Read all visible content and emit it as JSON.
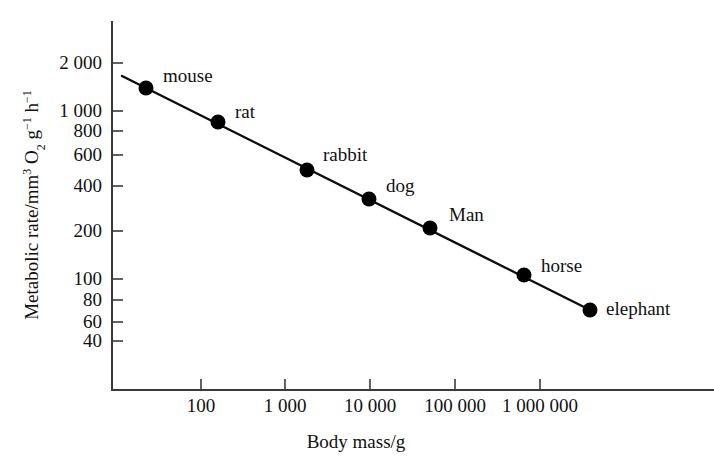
{
  "chart_data": {
    "type": "scatter",
    "title": "",
    "subtitle": "",
    "xlabel": "Body mass/g",
    "ylabel": "Metabolic rate/mm3 O2 g-1 h-1",
    "ylabel_parts": {
      "lead": "Metabolic rate/mm",
      "sup1": "3",
      "mid1": " O",
      "sub1": "2",
      "mid2": " g",
      "sup2": "−1",
      "mid3": " h",
      "sup3": "−1"
    },
    "xscale": "log",
    "yscale": "log",
    "xlim": [
      25,
      8000000
    ],
    "ylim": [
      33,
      3000
    ],
    "grid": false,
    "legend": "none",
    "x_tick_labels": [
      "100",
      "1 000",
      "10 000",
      "100 000",
      "1 000 000"
    ],
    "x_tick_values": [
      100,
      1000,
      10000,
      100000,
      1000000
    ],
    "y_tick_labels": [
      "2 000",
      "1 000",
      "800",
      "600",
      "400",
      "200",
      "100",
      "80",
      "60",
      "40"
    ],
    "y_tick_values": [
      2000,
      1000,
      800,
      600,
      400,
      200,
      100,
      80,
      60,
      40
    ],
    "point_labels": [
      "mouse",
      "rat",
      "rabbit",
      "dog",
      "Man",
      "horse",
      "elephant"
    ],
    "points": [
      {
        "label": "mouse",
        "x": 30,
        "y": 1400,
        "px": 146,
        "py": 88,
        "lx": 163,
        "ly": 82
      },
      {
        "label": "rat",
        "x": 180,
        "y": 900,
        "px": 218,
        "py": 122,
        "lx": 235,
        "ly": 118
      },
      {
        "label": "rabbit",
        "x": 2000,
        "y": 490,
        "px": 307,
        "py": 170,
        "lx": 323,
        "ly": 161
      },
      {
        "label": "dog",
        "x": 10000,
        "y": 330,
        "px": 369,
        "py": 199,
        "lx": 386,
        "ly": 192
      },
      {
        "label": "Man",
        "x": 50000,
        "y": 210,
        "px": 430,
        "py": 228,
        "lx": 449,
        "ly": 221
      },
      {
        "label": "horse",
        "x": 650000,
        "y": 100,
        "px": 524,
        "py": 275,
        "lx": 541,
        "ly": 272
      },
      {
        "label": "elephant",
        "x": 3000000,
        "y": 67,
        "px": 590,
        "py": 310,
        "lx": 606,
        "ly": 315
      }
    ],
    "trend_line": {
      "x1": 122,
      "y1": 76,
      "x2": 592,
      "y2": 311
    },
    "series": [
      {
        "name": "metabolic rate vs body mass",
        "x": [
          30,
          180,
          2000,
          10000,
          50000,
          650000,
          3000000
        ],
        "values": [
          1400,
          900,
          490,
          330,
          210,
          100,
          67
        ]
      }
    ],
    "colors": {
      "line": "#0d0d0d",
      "marker": "#000000",
      "axis": "#3a3a3a",
      "text": "#111111"
    }
  },
  "geometry": {
    "y_axis": {
      "x": 112,
      "y_top": 22,
      "y_bottom": 390
    },
    "x_axis": {
      "y": 390,
      "x_left": 112,
      "x_right": 714
    },
    "y_tick_px": [
      63,
      111,
      131,
      155,
      186,
      231,
      279,
      300,
      322,
      341
    ],
    "x_tick_px": [
      201,
      285,
      370,
      455,
      540
    ],
    "marker_radius": 7.5,
    "x_axis_title_pos": {
      "x": 356,
      "y": 448
    },
    "y_axis_title_pos": {
      "x": 38,
      "y": 205
    }
  }
}
